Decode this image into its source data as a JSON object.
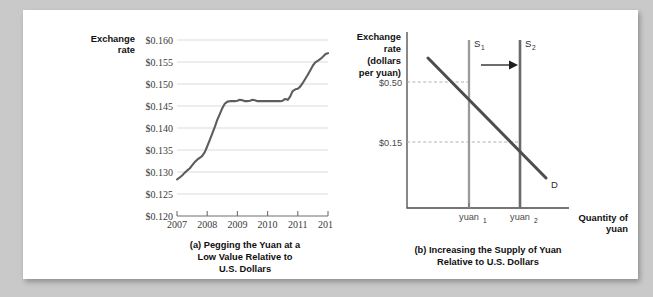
{
  "figure": {
    "background_color": "#c9c9c9",
    "panel_color": "#ffffff"
  },
  "chart_data": [
    {
      "type": "line",
      "panel": "a",
      "title": "",
      "caption_lines": [
        "(a) Pegging the Yuan at a",
        "Low Value Relative to",
        "U.S. Dollars"
      ],
      "ylabel_lines": [
        "Exchange",
        "rate"
      ],
      "xlabel": "",
      "ylim": [
        0.12,
        0.16
      ],
      "ytick_labels": [
        "$0.160",
        "$0.155",
        "$0.150",
        "$0.145",
        "$0.140",
        "$0.135",
        "$0.130",
        "$0.125",
        "$0.120"
      ],
      "ytick_values": [
        0.16,
        0.155,
        0.15,
        0.145,
        0.14,
        0.135,
        0.13,
        0.125,
        0.12
      ],
      "xtick_labels": [
        "2007",
        "2008",
        "2009",
        "2010",
        "2011",
        "2012"
      ],
      "xtick_values": [
        2007,
        2008,
        2009,
        2010,
        2011,
        2012
      ],
      "xlim": [
        2007,
        2012
      ],
      "grid": true,
      "legend": "none",
      "series": [
        {
          "name": "Yuan exchange rate",
          "color": "#5d5d5d",
          "x": [
            2007.0,
            2007.08,
            2007.17,
            2007.25,
            2007.33,
            2007.42,
            2007.5,
            2007.58,
            2007.67,
            2007.75,
            2007.83,
            2007.92,
            2008.0,
            2008.08,
            2008.17,
            2008.25,
            2008.33,
            2008.42,
            2008.5,
            2008.58,
            2008.67,
            2008.75,
            2008.83,
            2008.92,
            2009.0,
            2009.08,
            2009.17,
            2009.25,
            2009.33,
            2009.42,
            2009.5,
            2009.58,
            2009.67,
            2009.75,
            2009.83,
            2009.92,
            2010.0,
            2010.08,
            2010.17,
            2010.25,
            2010.33,
            2010.42,
            2010.5,
            2010.58,
            2010.67,
            2010.75,
            2010.83,
            2010.92,
            2011.0,
            2011.08,
            2011.17,
            2011.25,
            2011.33,
            2011.42,
            2011.5,
            2011.58,
            2011.67,
            2011.75,
            2011.83,
            2011.92,
            2012.0
          ],
          "y": [
            0.1283,
            0.1287,
            0.1292,
            0.1298,
            0.1303,
            0.1308,
            0.1315,
            0.1322,
            0.1328,
            0.1332,
            0.1336,
            0.1345,
            0.1358,
            0.1372,
            0.1388,
            0.1402,
            0.1418,
            0.1432,
            0.1445,
            0.1455,
            0.146,
            0.1461,
            0.1461,
            0.1461,
            0.1462,
            0.1464,
            0.1463,
            0.1461,
            0.1461,
            0.1462,
            0.1464,
            0.1463,
            0.1461,
            0.1461,
            0.1461,
            0.1461,
            0.1461,
            0.1461,
            0.1461,
            0.1461,
            0.1461,
            0.1461,
            0.1462,
            0.1466,
            0.1464,
            0.1472,
            0.1484,
            0.1488,
            0.1489,
            0.1494,
            0.1503,
            0.1512,
            0.1521,
            0.1532,
            0.1542,
            0.1549,
            0.1553,
            0.1557,
            0.1562,
            0.1568,
            0.157
          ]
        }
      ]
    },
    {
      "type": "line",
      "panel": "b",
      "title": "",
      "caption_lines": [
        "(b) Increasing the Supply of Yuan",
        "Relative to U.S. Dollars"
      ],
      "ylabel_lines": [
        "Exchange",
        "rate",
        "(dollars",
        "per yuan)"
      ],
      "xlabel_lines": [
        "Quantity of",
        "yuan"
      ],
      "ytick_labels": [
        "$0.50",
        "$0.15"
      ],
      "ytick_values": [
        0.5,
        0.15
      ],
      "xtick_labels": [
        "yuan",
        "yuan"
      ],
      "xtick_subscripts": [
        "1",
        "2"
      ],
      "grid": false,
      "legend": "none",
      "annotations": [
        {
          "name": "supply-1",
          "label": "S",
          "subscript": "1",
          "type": "vertical-line",
          "x": "yuan1",
          "color": "#9a9a9a"
        },
        {
          "name": "supply-2",
          "label": "S",
          "subscript": "2",
          "type": "vertical-line",
          "x": "yuan2",
          "color": "#6a6a6a"
        },
        {
          "name": "demand",
          "label": "D",
          "subscript": "",
          "type": "downward-sloping-line",
          "color": "#4d4d4d"
        },
        {
          "name": "shift-arrow",
          "label": "",
          "subscript": "",
          "type": "arrow-right",
          "color": "#1d1d1d"
        }
      ],
      "equilibria": [
        {
          "price": 0.5,
          "quantity": "yuan1"
        },
        {
          "price": 0.15,
          "quantity": "yuan2"
        }
      ]
    }
  ]
}
